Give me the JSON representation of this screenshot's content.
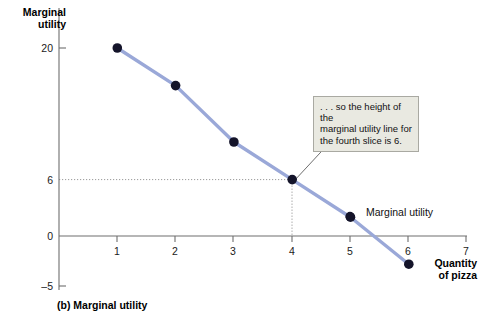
{
  "chart_data": {
    "type": "line",
    "title": "",
    "caption": "(b) Marginal utility",
    "xlabel": "Quantity of pizza",
    "ylabel": "Marginal utility",
    "x": [
      1,
      2,
      3,
      4,
      5,
      6
    ],
    "series": [
      {
        "name": "Marginal utility",
        "values": [
          20,
          16,
          10,
          6,
          2,
          -3
        ],
        "color": "#9aa8d8",
        "marker_color": "#14142a"
      }
    ],
    "xlim": [
      0,
      7
    ],
    "ylim": [
      -5,
      21
    ],
    "xticks": [
      1,
      2,
      3,
      4,
      5,
      6,
      7
    ],
    "xtick_labels": [
      "1",
      "2",
      "3",
      "4",
      "5",
      "6",
      "7"
    ],
    "yticks": [
      20,
      6,
      0,
      -5
    ],
    "ytick_labels": [
      "20",
      "6",
      "0",
      "–5"
    ],
    "grid": "dotted-guides-at-x4-y6",
    "guides": [
      {
        "type": "horizontal",
        "value": 6,
        "from_x": 0,
        "to_x": 4
      },
      {
        "type": "vertical",
        "value": 4,
        "from_y": 0,
        "to_y": 6
      }
    ],
    "legend_position": "inline-right-of-point-5",
    "annotations": [
      {
        "text": ". . . so the height of the marginal utility line for the fourth slice is 6.",
        "points_to_x": 4,
        "points_to_y": 6
      }
    ]
  },
  "axes": {
    "y_title_line1": "Marginal",
    "y_title_line2": "utility",
    "x_title_line1": "Quantity",
    "x_title_line2": "of pizza"
  },
  "annotation": {
    "line1": ". . . so the height of the",
    "line2": "marginal utility line for",
    "line3": "the fourth slice is 6."
  },
  "legend": {
    "series_label": "Marginal utility"
  },
  "caption": {
    "text": "(b) Marginal utility"
  },
  "ticks": {
    "y": [
      "20",
      "6",
      "0",
      "–5"
    ],
    "x": [
      "1",
      "2",
      "3",
      "4",
      "5",
      "6",
      "7"
    ]
  },
  "colors": {
    "line": "#9aa8d8",
    "marker": "#14142a",
    "axis": "#6e6e6e",
    "annotation_bg": "#e9e9e1",
    "annotation_border": "#a9a9a2"
  }
}
